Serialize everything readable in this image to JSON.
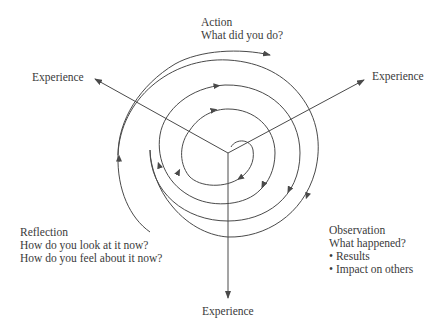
{
  "diagram": {
    "type": "cyclic-spiral",
    "center": [
      228,
      153
    ],
    "colors": {
      "line": "#4a4a4a",
      "text": "#3a3a3a",
      "background": "#ffffff"
    },
    "axes": [
      {
        "label": "Experience",
        "direction": "upper-left"
      },
      {
        "label": "Experience",
        "direction": "upper-right"
      },
      {
        "label": "Experience",
        "direction": "down"
      }
    ],
    "stages": {
      "action": {
        "title": "Action",
        "lines": [
          "What did you do?"
        ]
      },
      "observation": {
        "title": "Observation",
        "lines": [
          "What happened?"
        ],
        "bullets": [
          "Results",
          "Impact on others"
        ]
      },
      "reflection": {
        "title": "Reflection",
        "lines": [
          "How do you look at it now?",
          "How do you feel about it now?"
        ]
      }
    },
    "spiral_direction": "clockwise, outward"
  }
}
